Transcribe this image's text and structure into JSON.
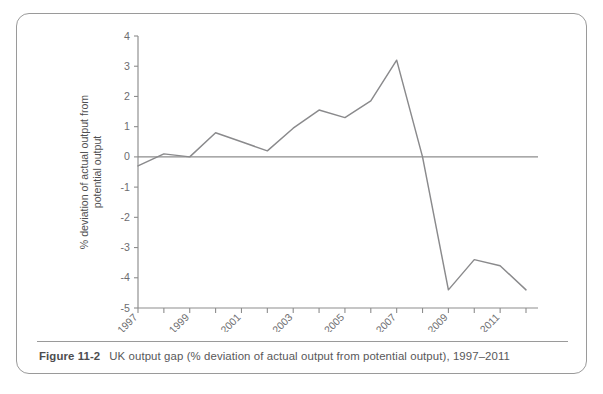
{
  "figure": {
    "caption_label": "Figure 11-2",
    "caption_text": "UK output gap (% deviation of actual output from potential output), 1997–2011"
  },
  "chart_data": {
    "type": "line",
    "title": "",
    "subtitle": "",
    "xlabel": "",
    "ylabel": "% deviation of actual output from potential output",
    "x": [
      1997,
      1998,
      1999,
      2000,
      2001,
      2002,
      2003,
      2004,
      2005,
      2006,
      2007,
      2008,
      2009,
      2010,
      2011,
      2012
    ],
    "values": [
      -0.3,
      0.1,
      0.0,
      0.8,
      0.5,
      0.2,
      0.95,
      1.55,
      1.3,
      1.85,
      3.2,
      0.0,
      -4.4,
      -3.4,
      -3.6,
      -4.4
    ],
    "series": [
      {
        "name": "UK output gap",
        "values": [
          -0.3,
          0.1,
          0.0,
          0.8,
          0.5,
          0.2,
          0.95,
          1.55,
          1.3,
          1.85,
          3.2,
          0.0,
          -4.4,
          -3.4,
          -3.6,
          -4.4
        ]
      }
    ],
    "xlim": [
      1997,
      2012
    ],
    "ylim": [
      -5,
      4
    ],
    "ytick_labels": [
      "4",
      "3",
      "2",
      "1",
      "0",
      "-1",
      "-2",
      "-3",
      "-4",
      "-5"
    ],
    "ytick_values": [
      4,
      3,
      2,
      1,
      0,
      -1,
      -2,
      -3,
      -4,
      -5
    ],
    "xtick_labels": [
      "1997",
      "1999",
      "2001",
      "2003",
      "2005",
      "2007",
      "2009",
      "2011"
    ],
    "xtick_values": [
      1997,
      1999,
      2001,
      2003,
      2005,
      2007,
      2009,
      2011
    ],
    "minor_xtick_values": [
      1998,
      2000,
      2002,
      2004,
      2006,
      2008,
      2010,
      2012
    ],
    "grid": false,
    "legend": false,
    "legend_position": "none",
    "zero_reference_line": 0,
    "line_color": "#8a8a8c",
    "axis_color": "#8d8d8d",
    "text_color": "#6d6d6f",
    "background_color": "#ffffff"
  }
}
